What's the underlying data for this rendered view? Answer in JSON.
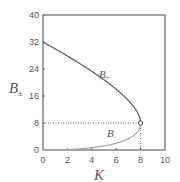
{
  "chart_data": {
    "type": "line",
    "title": "",
    "xlabel": "K",
    "ylabel": "B±",
    "xlim": [
      0,
      10
    ],
    "ylim": [
      0,
      40
    ],
    "xticks": [
      0,
      2,
      4,
      6,
      8,
      10
    ],
    "yticks": [
      0,
      8,
      16,
      24,
      32,
      40
    ],
    "grid": false,
    "series": [
      {
        "name": "B+",
        "x": [
          0,
          1,
          2,
          3,
          4,
          5,
          6,
          7,
          7.5,
          8
        ],
        "values": [
          32,
          29.0,
          25.9,
          22.7,
          19.3,
          15.8,
          12.0,
          11.0,
          10.0,
          8
        ]
      },
      {
        "name": "B-",
        "x": [
          0,
          1,
          2,
          3,
          4,
          5,
          6,
          7,
          7.5,
          8
        ],
        "values": [
          0,
          0.5,
          1.1,
          1.7,
          2.7,
          3.8,
          4.0,
          5.0,
          6.0,
          8
        ]
      }
    ],
    "annotations": [
      {
        "type": "point",
        "x": 8,
        "y": 8,
        "marker": "open-circle"
      },
      {
        "type": "dotted-line",
        "from": [
          0,
          8
        ],
        "to": [
          8,
          8
        ]
      },
      {
        "type": "dotted-line",
        "from": [
          8,
          0
        ],
        "to": [
          8,
          8
        ]
      },
      {
        "type": "label",
        "text": "B+",
        "x": 5.3,
        "y": 29
      },
      {
        "type": "label",
        "text": "B-",
        "x": 5.5,
        "y": 4
      }
    ]
  },
  "labels": {
    "x_axis": "K",
    "y_axis_main": "B",
    "y_axis_sub": "±",
    "b_plus_main": "B",
    "b_plus_sub": "+",
    "b_minus_main": "B",
    "b_minus_sub": "-"
  },
  "ticks": {
    "x": [
      "0",
      "2",
      "4",
      "6",
      "8",
      "10"
    ],
    "y": [
      "0",
      "8",
      "16",
      "24",
      "32",
      "40"
    ]
  }
}
